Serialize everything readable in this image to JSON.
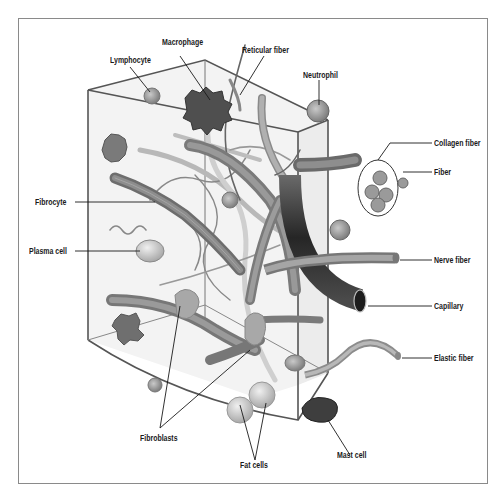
{
  "figure": {
    "labels": {
      "lymphocyte": "Lymphocyte",
      "macrophage": "Macrophage",
      "reticular_fiber": "Reticular fiber",
      "neutrophil": "Neutrophil",
      "collagen_fiber": "Collagen fiber",
      "fiber": "Fiber",
      "fibrocyte": "Fibrocyte",
      "plasma_cell": "Plasma cell",
      "nerve_fiber": "Nerve fiber",
      "capillary": "Capillary",
      "elastic_fiber": "Elastic fiber",
      "fibroblasts": "Fibroblasts",
      "fat_cells": "Fat cells",
      "mast_cell": "Mast cell"
    },
    "colors": {
      "frame": "#8a8a8a",
      "box_edge": "#555555",
      "leader_line": "#1a1a1a",
      "cell_fill": "#9a9a9a",
      "dark_cell": "#4a4a4a",
      "capillary": "#2e2e2e",
      "fiber_light": "#c8c8c8"
    }
  }
}
